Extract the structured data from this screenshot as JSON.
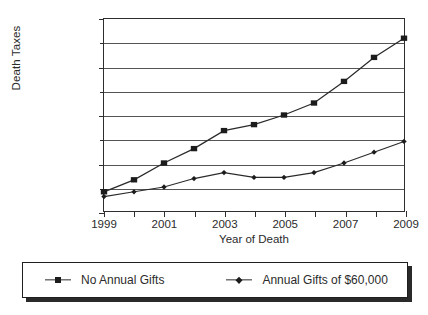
{
  "chart_data": {
    "type": "line",
    "title": "",
    "xlabel": "Year of Death",
    "ylabel": "Death Taxes",
    "x": [
      1999,
      2000,
      2001,
      2002,
      2003,
      2004,
      2005,
      2006,
      2007,
      2008,
      2009
    ],
    "categories": [
      "1999",
      "2000",
      "2001",
      "2002",
      "2003",
      "2004",
      "2005",
      "2006",
      "2007",
      "2008",
      "2009"
    ],
    "xlim": [
      1999,
      2009
    ],
    "ylim": [
      1.0,
      1.8
    ],
    "y_unit": "Million",
    "grid": true,
    "grid_axis": "y",
    "legend_position": "bottom",
    "x_tick_labels": [
      "1999",
      "2001",
      "2003",
      "2005",
      "2007",
      "2009"
    ],
    "x_tick_values": [
      1999,
      2001,
      2003,
      2005,
      2007,
      2009
    ],
    "y_tick_labels": [
      "$1 Million",
      "$1.2 Million",
      "$1.4 Million",
      "$1.6 Million",
      "$1.8 Million"
    ],
    "y_tick_values": [
      1.0,
      1.2,
      1.4,
      1.6,
      1.8
    ],
    "y_minor_tick_values": [
      1.1,
      1.3,
      1.5,
      1.7
    ],
    "series": [
      {
        "name": "No Annual Gifts",
        "marker": "square",
        "values": [
          1.08,
          1.13,
          1.2,
          1.26,
          1.335,
          1.36,
          1.4,
          1.45,
          1.54,
          1.64,
          1.72
        ]
      },
      {
        "name": "Annual Gifts of $60,000",
        "marker": "diamond",
        "values": [
          1.06,
          1.08,
          1.1,
          1.135,
          1.16,
          1.14,
          1.14,
          1.16,
          1.2,
          1.245,
          1.29
        ]
      }
    ]
  },
  "legend": {
    "items": [
      {
        "label": "No Annual Gifts",
        "marker": "square"
      },
      {
        "label": "Annual Gifts of $60,000",
        "marker": "diamond"
      }
    ]
  },
  "colors": {
    "axis": "#2e2e2e",
    "grid": "#555555",
    "series": "#2b2b2b",
    "background": "#ffffff"
  }
}
